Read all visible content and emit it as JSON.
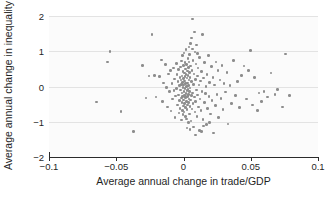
{
  "chart_data": {
    "type": "scatter",
    "title": "",
    "xlabel": "Average annual change in trade/GDP",
    "ylabel": "Average annual change in inequality",
    "xlim": [
      -0.1,
      0.1
    ],
    "ylim": [
      -2,
      2
    ],
    "xticks": [
      -0.1,
      -0.05,
      0,
      0.05,
      0.1
    ],
    "xtick_labels": [
      "−0.1",
      "−0.05",
      "0",
      "0.05",
      "0.1"
    ],
    "yticks": [
      2,
      1,
      0,
      -1,
      -2
    ],
    "ytick_labels": [
      "2",
      "1",
      "0",
      "−1",
      "−2"
    ],
    "grid": "horizontal",
    "legend": "none",
    "marker_color": "#8d8d8d",
    "marker_size_px": 2.6,
    "background_color": "#fbfbfb",
    "gridline_color": "#e3e3e3",
    "axis_color": "#2b2b2b",
    "n_points": 205,
    "points": [
      [
        -0.0648,
        -0.44
      ],
      [
        -0.0565,
        0.7
      ],
      [
        -0.0545,
        1.0
      ],
      [
        -0.0465,
        -0.71
      ],
      [
        -0.037,
        -1.27
      ],
      [
        -0.0305,
        0.59
      ],
      [
        -0.028,
        -0.33
      ],
      [
        -0.0255,
        0.3
      ],
      [
        -0.0235,
        1.47
      ],
      [
        -0.0215,
        0.32
      ],
      [
        -0.0205,
        -0.3
      ],
      [
        -0.018,
        0.28
      ],
      [
        -0.0165,
        0.75
      ],
      [
        -0.0155,
        -0.42
      ],
      [
        -0.015,
        0.1
      ],
      [
        -0.0135,
        0.62
      ],
      [
        -0.0128,
        -0.02
      ],
      [
        -0.012,
        -0.58
      ],
      [
        -0.0112,
        0.36
      ],
      [
        -0.0105,
        -0.15
      ],
      [
        -0.0098,
        0.45
      ],
      [
        -0.0092,
        -0.7
      ],
      [
        -0.0085,
        0.08
      ],
      [
        -0.008,
        -0.36
      ],
      [
        -0.0075,
        0.52
      ],
      [
        -0.007,
        -0.12
      ],
      [
        -0.0066,
        0.21
      ],
      [
        -0.0062,
        -0.88
      ],
      [
        -0.0058,
        -0.27
      ],
      [
        -0.0054,
        0.66
      ],
      [
        -0.005,
        -0.05
      ],
      [
        -0.0047,
        0.34
      ],
      [
        -0.0044,
        -0.52
      ],
      [
        -0.0041,
        0.14
      ],
      [
        -0.0038,
        -0.24
      ],
      [
        -0.0035,
        0.48
      ],
      [
        -0.0033,
        -0.75
      ],
      [
        -0.0031,
        0.02
      ],
      [
        -0.0029,
        -0.4
      ],
      [
        -0.0027,
        0.26
      ],
      [
        -0.0025,
        -0.62
      ],
      [
        -0.0023,
        0.55
      ],
      [
        -0.0021,
        -0.1
      ],
      [
        -0.0019,
        0.18
      ],
      [
        -0.0017,
        -0.33
      ],
      [
        -0.0015,
        0.72
      ],
      [
        -0.0014,
        -0.95
      ],
      [
        -0.0013,
        0.06
      ],
      [
        -0.0012,
        -0.46
      ],
      [
        -0.0011,
        0.3
      ],
      [
        -0.001,
        -0.18
      ],
      [
        -0.0009,
        0.88
      ],
      [
        -0.0008,
        -0.68
      ],
      [
        -0.0007,
        0.12
      ],
      [
        -0.0006,
        -0.28
      ],
      [
        -0.0005,
        0.42
      ],
      [
        -0.0004,
        -0.8
      ],
      [
        -0.0003,
        -0.02
      ],
      [
        -0.0002,
        0.6
      ],
      [
        -0.0001,
        -0.38
      ],
      [
        0.0,
        0.22
      ],
      [
        0.0001,
        -0.55
      ],
      [
        0.0002,
        0.04
      ],
      [
        0.0003,
        -0.15
      ],
      [
        0.0004,
        0.95
      ],
      [
        0.0005,
        -0.72
      ],
      [
        0.0006,
        0.38
      ],
      [
        0.0007,
        -0.25
      ],
      [
        0.0008,
        0.16
      ],
      [
        0.0009,
        -0.48
      ],
      [
        0.001,
        0.68
      ],
      [
        0.0011,
        -0.06
      ],
      [
        0.0012,
        0.28
      ],
      [
        0.0013,
        -0.85
      ],
      [
        0.0014,
        0.5
      ],
      [
        0.0015,
        -0.32
      ],
      [
        0.0016,
        0.08
      ],
      [
        0.0017,
        -0.6
      ],
      [
        0.0018,
        1.05
      ],
      [
        0.0019,
        -0.2
      ],
      [
        0.002,
        0.34
      ],
      [
        0.0021,
        -0.92
      ],
      [
        0.0022,
        0.0
      ],
      [
        0.0023,
        -0.42
      ],
      [
        0.0024,
        0.62
      ],
      [
        0.0025,
        -0.12
      ],
      [
        0.0026,
        0.24
      ],
      [
        0.0027,
        -0.66
      ],
      [
        0.0028,
        0.44
      ],
      [
        0.0029,
        -0.29
      ],
      [
        0.003,
        0.1
      ],
      [
        0.0031,
        -0.52
      ],
      [
        0.0032,
        0.8
      ],
      [
        0.0033,
        -0.08
      ],
      [
        0.0034,
        0.32
      ],
      [
        0.0035,
        -1.02
      ],
      [
        0.0036,
        0.54
      ],
      [
        0.0037,
        -0.22
      ],
      [
        0.0038,
        0.02
      ],
      [
        0.0039,
        -0.45
      ],
      [
        0.004,
        0.7
      ],
      [
        0.0041,
        -0.35
      ],
      [
        0.0042,
        0.18
      ],
      [
        0.0043,
        -0.78
      ],
      [
        0.0044,
        0.4
      ],
      [
        0.0045,
        -0.14
      ],
      [
        0.0046,
        0.9
      ],
      [
        0.0047,
        -0.56
      ],
      [
        0.0048,
        0.26
      ],
      [
        0.0049,
        -0.04
      ],
      [
        0.005,
        1.22
      ],
      [
        0.0052,
        -0.38
      ],
      [
        0.0054,
        0.58
      ],
      [
        0.0056,
        -0.98
      ],
      [
        0.0058,
        0.14
      ],
      [
        0.006,
        -0.26
      ],
      [
        0.0062,
        0.46
      ],
      [
        0.0064,
        -0.64
      ],
      [
        0.0066,
        1.92
      ],
      [
        0.0068,
        -0.18
      ],
      [
        0.007,
        0.74
      ],
      [
        0.0072,
        -0.48
      ],
      [
        0.0074,
        0.06
      ],
      [
        0.0076,
        -1.15
      ],
      [
        0.0078,
        0.36
      ],
      [
        0.008,
        -0.3
      ],
      [
        0.0082,
        1.55
      ],
      [
        0.0084,
        0.98
      ],
      [
        0.0086,
        -0.72
      ],
      [
        0.0088,
        0.2
      ],
      [
        0.009,
        -0.42
      ],
      [
        0.0092,
        0.64
      ],
      [
        0.0095,
        -0.1
      ],
      [
        0.0098,
        1.18
      ],
      [
        0.01,
        -0.85
      ],
      [
        0.0103,
        0.3
      ],
      [
        0.0106,
        -0.24
      ],
      [
        0.0109,
        0.52
      ],
      [
        0.0112,
        -0.58
      ],
      [
        0.0115,
        0.04
      ],
      [
        0.0118,
        -1.25
      ],
      [
        0.0121,
        0.82
      ],
      [
        0.0124,
        -0.36
      ],
      [
        0.0127,
        0.16
      ],
      [
        0.013,
        -0.68
      ],
      [
        0.0134,
        0.42
      ],
      [
        0.0138,
        -0.14
      ],
      [
        0.0142,
        1.48
      ],
      [
        0.0146,
        -0.94
      ],
      [
        0.015,
        0.24
      ],
      [
        0.0154,
        -0.46
      ],
      [
        0.0158,
        0.68
      ],
      [
        0.0162,
        -0.2
      ],
      [
        0.0166,
        0.0
      ],
      [
        0.017,
        -1.08
      ],
      [
        0.0175,
        0.34
      ],
      [
        0.018,
        -0.62
      ],
      [
        0.0185,
        0.88
      ],
      [
        0.019,
        -0.28
      ],
      [
        0.0195,
        0.12
      ],
      [
        0.02,
        -0.78
      ],
      [
        0.0206,
        0.56
      ],
      [
        0.0212,
        -0.4
      ],
      [
        0.0218,
        0.26
      ],
      [
        0.0224,
        -1.32
      ],
      [
        0.023,
        0.04
      ],
      [
        0.0236,
        -0.54
      ],
      [
        0.0242,
        0.7
      ],
      [
        0.0248,
        -0.22
      ],
      [
        0.0255,
        0.46
      ],
      [
        0.0262,
        -0.88
      ],
      [
        0.027,
        0.18
      ],
      [
        0.0278,
        -0.34
      ],
      [
        0.0286,
        0.6
      ],
      [
        0.0294,
        -0.66
      ],
      [
        0.0302,
        0.08
      ],
      [
        0.0312,
        -0.16
      ],
      [
        0.0322,
        0.4
      ],
      [
        0.0332,
        -1.06
      ],
      [
        0.0345,
        0.02
      ],
      [
        0.0358,
        -0.48
      ],
      [
        0.0372,
        0.74
      ],
      [
        0.0386,
        -0.26
      ],
      [
        0.04,
        0.14
      ],
      [
        0.0415,
        -0.6
      ],
      [
        0.0432,
        0.32
      ],
      [
        0.045,
        0.58
      ],
      [
        0.0468,
        -0.36
      ],
      [
        0.0485,
        0.46
      ],
      [
        0.05,
        1.02
      ],
      [
        0.0515,
        -0.52
      ],
      [
        0.053,
        0.26
      ],
      [
        0.0548,
        -0.68
      ],
      [
        0.0562,
        -0.18
      ],
      [
        0.058,
        -0.42
      ],
      [
        0.06,
        -0.14
      ],
      [
        0.0625,
        -0.3
      ],
      [
        0.065,
        0.38
      ],
      [
        0.068,
        -0.22
      ],
      [
        0.07,
        -0.08
      ],
      [
        0.0735,
        -0.58
      ],
      [
        0.076,
        0.92
      ],
      [
        0.079,
        -0.26
      ],
      [
        0.0042,
        1.12
      ],
      [
        0.0068,
        1.06
      ],
      [
        0.0105,
        0.94
      ],
      [
        0.0025,
        -1.18
      ],
      [
        0.0048,
        -1.22
      ],
      [
        0.015,
        -1.12
      ],
      [
        0.0195,
        -1.02
      ],
      [
        0.0088,
        -1.38
      ],
      [
        0.0135,
        -1.28
      ],
      [
        0.006,
        1.38
      ]
    ]
  }
}
